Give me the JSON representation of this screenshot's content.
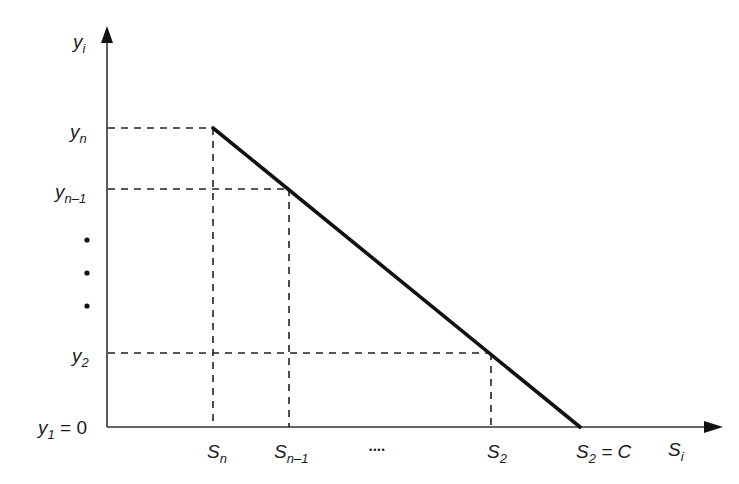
{
  "diagram": {
    "type": "piecewise-linear",
    "colors": {
      "line": "#111111",
      "axis": "#333333",
      "dash": "#222222",
      "background": "#ffffff"
    },
    "axes": {
      "y": {
        "label": "y",
        "label_sub": "i"
      },
      "x": {
        "label": "S",
        "label_sub": "i"
      }
    },
    "y_ticks": [
      {
        "base": "y",
        "sub": "n",
        "suffix": ""
      },
      {
        "base": "y",
        "sub": "n–1",
        "suffix": ""
      },
      {
        "base": "y",
        "sub": "2",
        "suffix": ""
      },
      {
        "base": "y",
        "sub": "1",
        "suffix": " = 0"
      }
    ],
    "x_ticks": [
      {
        "base": "S",
        "sub": "n",
        "suffix": ""
      },
      {
        "base": "S",
        "sub": "n–1",
        "suffix": ""
      },
      {
        "base": "S",
        "sub": "2",
        "suffix": ""
      },
      {
        "base": "S",
        "sub": "2",
        "suffix": " = C"
      }
    ],
    "x_ellipsis": "••••",
    "y_ellipsis_dots": 3
  }
}
